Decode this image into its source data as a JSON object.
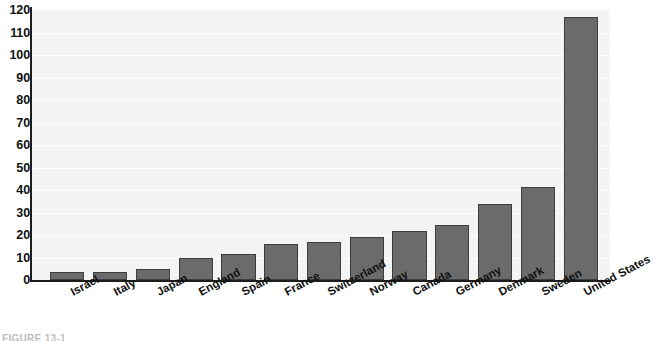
{
  "chart_data": {
    "type": "bar",
    "title": "",
    "xlabel": "",
    "ylabel": "",
    "ylim": [
      0,
      120
    ],
    "ytick_values": [
      0,
      10,
      20,
      30,
      40,
      50,
      60,
      70,
      80,
      90,
      100,
      110,
      120
    ],
    "ytick_labels": [
      "0",
      "10",
      "20",
      "30",
      "40",
      "50",
      "60",
      "70",
      "80",
      "90",
      "100",
      "110",
      "120"
    ],
    "grid": true,
    "legend": "none",
    "categories": [
      "Israel",
      "Italy",
      "Japan",
      "England",
      "Spain",
      "France",
      "Switzerland",
      "Norway",
      "Canada",
      "Germany",
      "Denmark",
      "Sweden",
      "United States"
    ],
    "values": [
      3.5,
      3.5,
      5,
      10,
      11.5,
      16,
      17,
      19,
      22,
      24.5,
      34,
      41.5,
      117
    ],
    "bar_color": "#6b6b6b",
    "bar_edge_color": "#3d3d3d",
    "plot_background": "#f4f4f4",
    "axis_color": "#1c1c1c"
  },
  "caption": {
    "text": "FIGURE 13-1"
  }
}
